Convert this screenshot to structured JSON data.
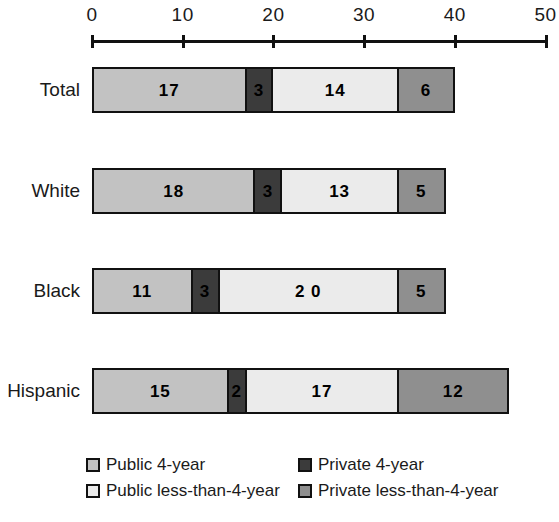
{
  "chart_data": {
    "type": "bar",
    "orientation": "horizontal",
    "stacked": true,
    "title": "",
    "xlabel": "",
    "ylabel": "",
    "xlim": [
      0,
      50
    ],
    "xticks": [
      0,
      10,
      20,
      30,
      40,
      50
    ],
    "xtick_labels": [
      "0",
      "10",
      "20",
      "30",
      "40",
      "50"
    ],
    "grid": false,
    "legend_position": "bottom",
    "categories": [
      "Total",
      "White",
      "Black",
      "Hispanic"
    ],
    "series": [
      {
        "name": "Public 4-year",
        "color": "#c2c2c2",
        "values": [
          17,
          18,
          11,
          15
        ],
        "labels": [
          "17",
          "18",
          "11",
          "15"
        ]
      },
      {
        "name": "Private 4-year",
        "color": "#3b3b3b",
        "values": [
          3,
          3,
          3,
          2
        ],
        "labels": [
          "3",
          "3",
          "3",
          "2"
        ]
      },
      {
        "name": "Public less-than-4-year",
        "color": "#ebebeb",
        "values": [
          14,
          13,
          20,
          17
        ],
        "labels": [
          "14",
          "13",
          "2 0",
          "17"
        ]
      },
      {
        "name": "Private less-than-4-year",
        "color": "#8f8f8f",
        "values": [
          6,
          5,
          5,
          12
        ],
        "labels": [
          "6",
          "5",
          "5",
          "12"
        ]
      }
    ],
    "totals": [
      40,
      39,
      39,
      46
    ]
  },
  "axis": {
    "ticks": [
      {
        "label": "0",
        "value": 0
      },
      {
        "label": "10",
        "value": 10
      },
      {
        "label": "20",
        "value": 20
      },
      {
        "label": "30",
        "value": 30
      },
      {
        "label": "40",
        "value": 40
      },
      {
        "label": "50",
        "value": 50
      }
    ]
  },
  "legend": {
    "items": [
      {
        "label": "Public 4-year",
        "color": "#c2c2c2"
      },
      {
        "label": "Private 4-year",
        "color": "#3b3b3b"
      },
      {
        "label": "Public less-than-4-year",
        "color": "#ebebeb"
      },
      {
        "label": "Private less-than-4-year",
        "color": "#8f8f8f"
      }
    ]
  },
  "colors": {
    "public_4_year": "#c2c2c2",
    "private_4_year": "#3b3b3b",
    "public_less_than_4_year": "#ebebeb",
    "private_less_than_4_year": "#8f8f8f",
    "outline": "#111111",
    "background": "#ffffff"
  }
}
